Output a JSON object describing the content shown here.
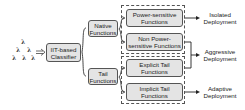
{
  "diagram": {
    "input": {
      "symbol": "λ",
      "count": 6
    },
    "classifier": {
      "label": "IIT-based Classifier"
    },
    "categories": [
      {
        "label": "Native Functions"
      },
      {
        "label": "Tail Functions"
      }
    ],
    "subcategories": [
      {
        "label": "Power-sensitive Functions"
      },
      {
        "label": "Non Power-sensitive Functions"
      },
      {
        "label": "Explicit Tail Functions"
      },
      {
        "label": "Implicit Tail Functions"
      }
    ],
    "deployments": [
      {
        "label": "Isolated Deployment"
      },
      {
        "label": "Aggressive Deployment"
      },
      {
        "label": "Adaptive Deployment"
      }
    ],
    "colors": {
      "box_fill": "#e4e4e4",
      "stroke": "#555555"
    }
  }
}
